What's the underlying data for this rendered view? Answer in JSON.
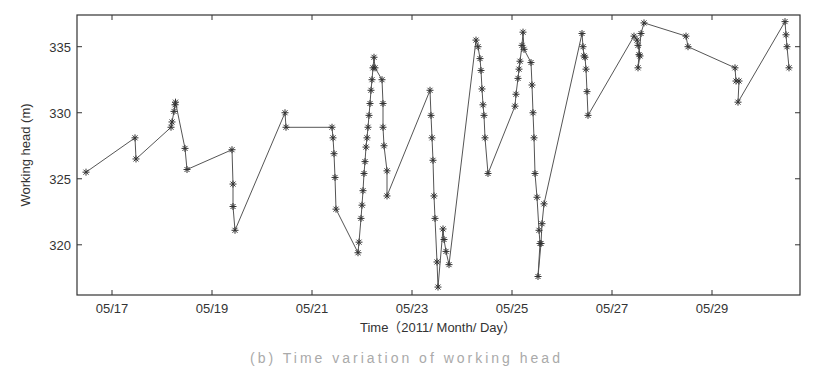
{
  "chart_data": {
    "type": "line",
    "marker": "asterisk",
    "title": "",
    "xlabel": "Time（2011/ Month/ Day）",
    "ylabel": "Working head (m)",
    "xlim": [
      16.3,
      30.76
    ],
    "ylim": [
      316.2,
      337.4
    ],
    "x_ticks": [
      17,
      19,
      21,
      23,
      25,
      27,
      29
    ],
    "x_tick_labels": [
      "05/17",
      "05/19",
      "05/21",
      "05/23",
      "05/25",
      "05/27",
      "05/29"
    ],
    "y_ticks": [
      320,
      325,
      330,
      335
    ],
    "y_tick_labels": [
      "320",
      "325",
      "330",
      "335"
    ],
    "grid": false,
    "line_color": "#555555",
    "series": [
      {
        "name": "Working head",
        "points": [
          [
            16.48,
            325.5
          ],
          [
            17.46,
            328.1
          ],
          [
            17.48,
            326.5
          ],
          [
            18.18,
            328.9
          ],
          [
            18.2,
            329.3
          ],
          [
            18.24,
            330.1
          ],
          [
            18.26,
            330.6
          ],
          [
            18.27,
            330.8
          ],
          [
            18.46,
            327.3
          ],
          [
            18.5,
            325.7
          ],
          [
            19.4,
            327.2
          ],
          [
            19.42,
            324.6
          ],
          [
            19.42,
            322.9
          ],
          [
            19.46,
            321.1
          ],
          [
            20.46,
            330.0
          ],
          [
            20.48,
            328.9
          ],
          [
            21.4,
            328.9
          ],
          [
            21.42,
            328.1
          ],
          [
            21.44,
            326.9
          ],
          [
            21.46,
            325.1
          ],
          [
            21.48,
            322.7
          ],
          [
            21.92,
            319.4
          ],
          [
            21.94,
            320.2
          ],
          [
            21.98,
            322.0
          ],
          [
            22.0,
            323.0
          ],
          [
            22.02,
            324.1
          ],
          [
            22.04,
            325.4
          ],
          [
            22.06,
            326.3
          ],
          [
            22.08,
            327.4
          ],
          [
            22.1,
            328.1
          ],
          [
            22.12,
            328.9
          ],
          [
            22.14,
            329.8
          ],
          [
            22.16,
            330.7
          ],
          [
            22.18,
            331.7
          ],
          [
            22.2,
            332.5
          ],
          [
            22.22,
            333.4
          ],
          [
            22.24,
            334.2
          ],
          [
            22.26,
            333.4
          ],
          [
            22.4,
            332.5
          ],
          [
            22.42,
            330.7
          ],
          [
            22.42,
            328.9
          ],
          [
            22.44,
            327.5
          ],
          [
            22.5,
            325.6
          ],
          [
            22.5,
            323.7
          ],
          [
            23.36,
            331.7
          ],
          [
            23.38,
            329.8
          ],
          [
            23.4,
            328.1
          ],
          [
            23.42,
            326.4
          ],
          [
            23.44,
            323.7
          ],
          [
            23.46,
            322.0
          ],
          [
            23.5,
            318.7
          ],
          [
            23.52,
            316.8
          ],
          [
            23.62,
            321.2
          ],
          [
            23.64,
            320.4
          ],
          [
            23.68,
            319.5
          ],
          [
            23.74,
            318.5
          ],
          [
            24.28,
            335.5
          ],
          [
            24.32,
            335.0
          ],
          [
            24.36,
            334.1
          ],
          [
            24.38,
            333.2
          ],
          [
            24.4,
            331.8
          ],
          [
            24.42,
            330.6
          ],
          [
            24.44,
            329.8
          ],
          [
            24.46,
            328.1
          ],
          [
            24.52,
            325.4
          ],
          [
            25.06,
            330.5
          ],
          [
            25.08,
            331.4
          ],
          [
            25.12,
            332.6
          ],
          [
            25.14,
            333.3
          ],
          [
            25.16,
            333.9
          ],
          [
            25.2,
            335.1
          ],
          [
            25.22,
            336.1
          ],
          [
            25.24,
            334.8
          ],
          [
            25.38,
            333.8
          ],
          [
            25.4,
            332.1
          ],
          [
            25.42,
            330.0
          ],
          [
            25.44,
            328.1
          ],
          [
            25.46,
            325.4
          ],
          [
            25.5,
            323.6
          ],
          [
            25.54,
            321.1
          ],
          [
            25.56,
            320.1
          ],
          [
            25.52,
            317.6
          ],
          [
            25.58,
            320.1
          ],
          [
            25.6,
            321.6
          ],
          [
            25.64,
            323.1
          ],
          [
            26.4,
            336.0
          ],
          [
            26.42,
            335.0
          ],
          [
            26.44,
            334.3
          ],
          [
            26.46,
            334.2
          ],
          [
            26.48,
            333.3
          ],
          [
            26.5,
            331.6
          ],
          [
            26.52,
            329.8
          ],
          [
            27.44,
            335.8
          ],
          [
            27.5,
            335.5
          ],
          [
            27.52,
            335.1
          ],
          [
            27.56,
            334.3
          ],
          [
            27.52,
            333.4
          ],
          [
            27.54,
            334.4
          ],
          [
            27.58,
            336.0
          ],
          [
            27.64,
            336.8
          ],
          [
            28.48,
            335.8
          ],
          [
            28.52,
            335.0
          ],
          [
            29.46,
            333.4
          ],
          [
            29.48,
            332.4
          ],
          [
            29.54,
            332.4
          ],
          [
            29.52,
            330.8
          ],
          [
            30.46,
            336.9
          ],
          [
            30.48,
            335.9
          ],
          [
            30.5,
            335.0
          ],
          [
            30.54,
            333.4
          ]
        ]
      }
    ]
  },
  "caption": "(b) Time variation of working head"
}
